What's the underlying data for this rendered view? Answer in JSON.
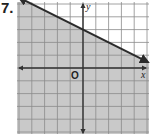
{
  "problem": {
    "number": "7."
  },
  "chart_data": {
    "type": "line",
    "title": "",
    "xlabel": "x",
    "ylabel": "y",
    "origin_label": "O",
    "xlim": [
      -5,
      5
    ],
    "ylim": [
      -5,
      5
    ],
    "grid": true,
    "tick_labels": false,
    "series": [
      {
        "name": "boundary line",
        "equation": "y = -1/2 x + 3",
        "style": "solid",
        "arrows": "both",
        "x": [
          -5.2,
          5.2
        ],
        "y": [
          5.6,
          0.4
        ]
      }
    ],
    "shaded_region": "below line",
    "inequality": "y <= -1/2 x + 3",
    "colors": {
      "shade": "#c9c9c9",
      "grid": "#8a8a8a",
      "line": "#2b2b2b",
      "axis": "#333333"
    }
  }
}
